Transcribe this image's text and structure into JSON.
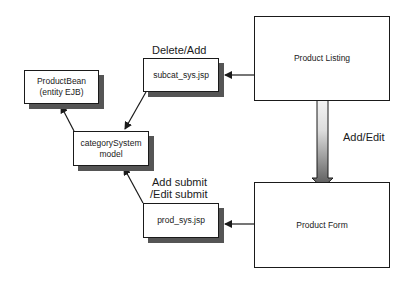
{
  "diagram": {
    "nodes": {
      "product_bean": {
        "line1": "ProductBean",
        "line2": "(entity EJB)"
      },
      "subcat_sys": {
        "label": "subcat_sys.jsp"
      },
      "product_listing": {
        "label": "Product Listing"
      },
      "category_system": {
        "line1": "categorySystem",
        "line2": "model"
      },
      "prod_sys": {
        "label": "prod_sys.jsp"
      },
      "product_form": {
        "label": "Product Form"
      }
    },
    "edge_labels": {
      "delete_add": "Delete/Add",
      "add_edit": "Add/Edit",
      "add_submit": "Add submit",
      "edit_submit": "/Edit submit"
    },
    "colors": {
      "stroke": "#1a1a1a",
      "shadow": "#555555",
      "arrow_gradient_top": "#f2f2f2",
      "arrow_gradient_bottom": "#5a5a5a"
    }
  }
}
